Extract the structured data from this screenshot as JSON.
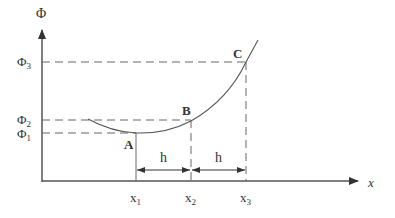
{
  "diagram": {
    "y_axis_label": "Φ",
    "x_axis_label": "x",
    "y_ticks": [
      {
        "label": "Φ",
        "sub": "3"
      },
      {
        "label": "Φ",
        "sub": "2"
      },
      {
        "label": "Φ",
        "sub": "1"
      }
    ],
    "x_ticks": [
      {
        "label": "x",
        "sub": "1"
      },
      {
        "label": "x",
        "sub": "2"
      },
      {
        "label": "x",
        "sub": "3"
      }
    ],
    "points": [
      {
        "name": "A"
      },
      {
        "name": "B"
      },
      {
        "name": "C"
      }
    ],
    "intervals": [
      {
        "label": "h"
      },
      {
        "label": "h"
      }
    ],
    "colors": {
      "line": "#555555",
      "text": "#333333",
      "background": "#ffffff"
    }
  }
}
